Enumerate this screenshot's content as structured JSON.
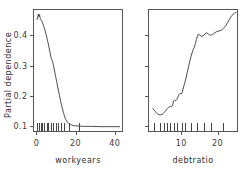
{
  "figure": {
    "background": "#ffffff",
    "line_color": "#3a3a3a",
    "axis_color": "#555555",
    "shared_ylabel": "Partial dependence"
  },
  "chart_data": [
    {
      "type": "line",
      "panel": "left",
      "title": "",
      "xlabel": "workyears",
      "ylabel": "Partial dependence",
      "xlim": [
        -1.5,
        44
      ],
      "ylim": [
        0.082,
        0.485
      ],
      "xticks": [
        0,
        20,
        40
      ],
      "xticklabels": [
        "0",
        "20",
        "40"
      ],
      "yticks": [
        0.1,
        0.2,
        0.3,
        0.4
      ],
      "yticklabels": [
        "0.1",
        "0.2",
        "0.3",
        "0.4"
      ],
      "grid": false,
      "legend": null,
      "rug": [
        0.4,
        1.3,
        2.2,
        3.0,
        3.9,
        5.2,
        6.1,
        7.4,
        8.6,
        9.9,
        11.2,
        12.6,
        14.1,
        16.4,
        21.8
      ],
      "x": [
        0.3,
        0.7,
        1.0,
        1.3,
        1.6,
        1.9,
        2.1,
        2.4,
        2.7,
        3.0,
        3.4,
        3.8,
        4.3,
        4.8,
        5.3,
        5.8,
        6.3,
        6.8,
        7.2,
        7.6,
        8.0,
        8.3,
        8.6,
        9.0,
        9.4,
        9.8,
        10.3,
        10.8,
        11.3,
        11.8,
        12.3,
        12.8,
        13.3,
        13.8,
        14.2,
        14.6,
        15.0,
        15.4,
        15.8,
        16.3,
        16.8,
        17.4,
        18.2,
        19.5,
        21.5,
        24.0,
        28.0,
        33.0,
        38.0,
        42.5
      ],
      "y": [
        0.452,
        0.462,
        0.47,
        0.461,
        0.468,
        0.456,
        0.452,
        0.45,
        0.447,
        0.443,
        0.436,
        0.428,
        0.418,
        0.406,
        0.393,
        0.379,
        0.364,
        0.348,
        0.335,
        0.322,
        0.318,
        0.312,
        0.303,
        0.291,
        0.278,
        0.264,
        0.248,
        0.232,
        0.216,
        0.2,
        0.184,
        0.17,
        0.157,
        0.145,
        0.136,
        0.128,
        0.122,
        0.117,
        0.113,
        0.11,
        0.107,
        0.105,
        0.103,
        0.101,
        0.1,
        0.099,
        0.099,
        0.098,
        0.098,
        0.098
      ]
    },
    {
      "type": "line",
      "panel": "right",
      "title": "",
      "xlabel": "debtratio",
      "ylabel": "Partial dependence",
      "xlim": [
        1.0,
        25.5
      ],
      "ylim": [
        0.082,
        0.485
      ],
      "xticks": [
        10,
        20
      ],
      "xticklabels": [
        "10",
        "20"
      ],
      "yticks": [
        0.1,
        0.2,
        0.3,
        0.4
      ],
      "yticklabels": [
        "",
        "",
        "",
        ""
      ],
      "grid": false,
      "legend": null,
      "rug": [
        2.6,
        4.2,
        5.2,
        6.1,
        7.0,
        7.9,
        8.8,
        10.2,
        11.1,
        12.6,
        14.4,
        16.3,
        18.2,
        21.4
      ],
      "x": [
        2.2,
        2.6,
        3.0,
        3.4,
        3.8,
        4.2,
        4.6,
        5.0,
        5.4,
        5.8,
        6.2,
        6.6,
        7.0,
        7.3,
        7.6,
        7.9,
        8.2,
        8.5,
        8.8,
        9.1,
        9.4,
        9.7,
        10.0,
        10.3,
        10.6,
        10.9,
        11.2,
        11.5,
        11.8,
        12.1,
        12.4,
        12.7,
        13.0,
        13.3,
        13.6,
        13.9,
        14.2,
        14.5,
        14.8,
        15.1,
        15.5,
        16.0,
        16.5,
        17.0,
        17.5,
        18.0,
        18.6,
        19.2,
        19.8,
        20.4,
        21.0,
        21.6,
        22.2,
        22.8,
        23.4,
        24.0,
        24.6,
        25.1
      ],
      "y": [
        0.158,
        0.152,
        0.146,
        0.141,
        0.138,
        0.137,
        0.138,
        0.141,
        0.146,
        0.152,
        0.158,
        0.162,
        0.166,
        0.163,
        0.168,
        0.183,
        0.186,
        0.184,
        0.188,
        0.196,
        0.204,
        0.208,
        0.206,
        0.212,
        0.226,
        0.24,
        0.252,
        0.268,
        0.284,
        0.3,
        0.316,
        0.33,
        0.342,
        0.352,
        0.36,
        0.372,
        0.386,
        0.398,
        0.404,
        0.401,
        0.396,
        0.398,
        0.404,
        0.408,
        0.404,
        0.4,
        0.402,
        0.408,
        0.412,
        0.414,
        0.416,
        0.422,
        0.43,
        0.442,
        0.456,
        0.466,
        0.472,
        0.476
      ]
    }
  ]
}
